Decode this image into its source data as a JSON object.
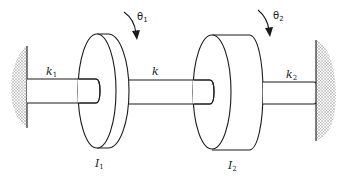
{
  "diagram": {
    "labels": {
      "k1": {
        "base": "k",
        "sub": "1"
      },
      "k": {
        "base": "k",
        "sub": ""
      },
      "k2": {
        "base": "k",
        "sub": "2"
      },
      "I1": {
        "base": "I",
        "sub": "1"
      },
      "I2": {
        "base": "I",
        "sub": "2"
      },
      "theta1": {
        "base": "θ",
        "sub": "1"
      },
      "theta2": {
        "base": "θ",
        "sub": "2"
      }
    },
    "components": [
      {
        "id": "left-wall",
        "type": "fixed support"
      },
      {
        "id": "shaft-k1",
        "type": "shaft",
        "stiffness": "k1"
      },
      {
        "id": "disc-I1",
        "type": "disc",
        "inertia": "I1",
        "rotation": "θ1"
      },
      {
        "id": "shaft-k",
        "type": "shaft",
        "stiffness": "k"
      },
      {
        "id": "disc-I2",
        "type": "disc",
        "inertia": "I2",
        "rotation": "θ2"
      },
      {
        "id": "shaft-k2",
        "type": "shaft",
        "stiffness": "k2"
      },
      {
        "id": "right-wall",
        "type": "fixed support"
      }
    ],
    "colors": {
      "line": "#1a1a1a",
      "stipple": "#9a9a9a",
      "background": "#ffffff"
    }
  }
}
